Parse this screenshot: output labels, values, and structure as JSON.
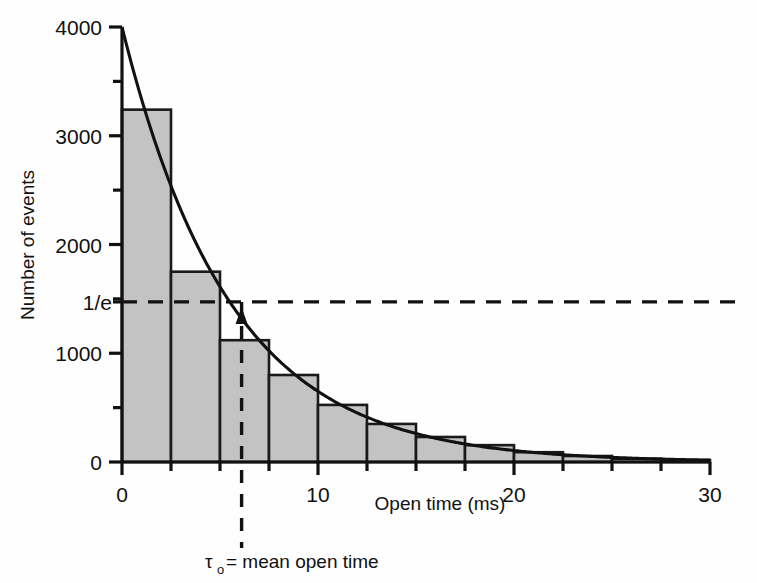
{
  "figure": {
    "background": "#fefefe",
    "bar_fill": "#c3c3c3",
    "bar_stroke": "#1a1a1a",
    "axis_color": "#111111",
    "curve_color": "#111111"
  },
  "chart_data": {
    "type": "bar",
    "title": "",
    "xlabel": "Open time (ms)",
    "ylabel": "Number of events",
    "xlim": [
      0,
      30
    ],
    "ylim": [
      0,
      4000
    ],
    "grid": false,
    "legend": "none",
    "bin_width": 2.5,
    "x_major_ticks": [
      0,
      10,
      20,
      30
    ],
    "x_major_tick_labels": [
      "0",
      "10",
      "20",
      "30"
    ],
    "x_minor_ticks": [
      2.5,
      5,
      7.5,
      12.5,
      15,
      17.5,
      22.5,
      25,
      27.5
    ],
    "y_major_ticks": [
      0,
      1000,
      2000,
      3000,
      4000
    ],
    "y_major_tick_labels": [
      "0",
      "1000",
      "2000",
      "3000",
      "4000"
    ],
    "y_minor_ticks": [
      500,
      1500,
      2500,
      3500
    ],
    "y_special_tick": {
      "value": 1472,
      "label": "1/e"
    },
    "bin_left_edges": [
      0,
      2.5,
      5,
      7.5,
      10,
      12.5,
      15,
      17.5,
      20,
      22.5,
      25,
      27.5
    ],
    "values": [
      3240,
      1750,
      1120,
      800,
      525,
      350,
      230,
      155,
      90,
      55,
      30,
      18
    ],
    "fit_curve": {
      "label": "single exponential fit",
      "type": "exponential",
      "amplitude": 4000,
      "tau": 5.5,
      "equation": "N = 4000 * exp(-t / 5.5)"
    },
    "annotations": [
      {
        "name": "one-over-e-line",
        "kind": "horizontal-dashed",
        "y": 1472,
        "label": "1/e"
      },
      {
        "name": "tau-line",
        "kind": "vertical-dashed",
        "x": 6.1,
        "label": "τo"
      },
      {
        "name": "tau-arrow",
        "kind": "arrow-up",
        "x": 6.1
      },
      {
        "name": "tau-caption",
        "kind": "text",
        "text": "= mean open time",
        "symbol": "τ",
        "subscript": "o"
      }
    ]
  },
  "labels": {
    "y_axis_title": "Number of events",
    "x_axis_title": "Open time (ms)",
    "one_over_e": "1/e",
    "tau_symbol": "τ",
    "tau_subscript": "o",
    "tau_caption": "= mean open time"
  }
}
